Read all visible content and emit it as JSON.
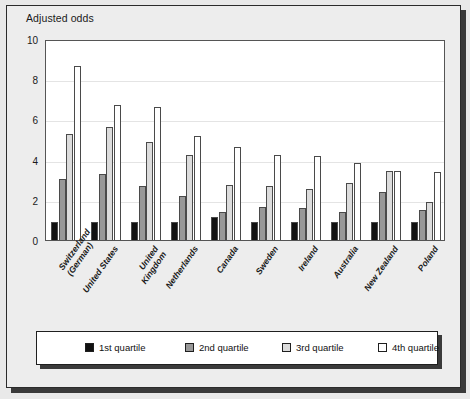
{
  "chart_data": {
    "type": "bar",
    "title": "Adjusted odds",
    "xlabel": "",
    "ylabel": "Adjusted odds",
    "ylim": [
      0,
      10
    ],
    "yticks": [
      0,
      2,
      4,
      6,
      8,
      10
    ],
    "grid": true,
    "legend_position": "bottom",
    "categories": [
      "Switzerland\n(German)",
      "United States",
      "United\nKingdom",
      "Netherlands",
      "Canada",
      "Sweden",
      "Ireland",
      "Australia",
      "New Zealand",
      "Poland"
    ],
    "series": [
      {
        "name": "1st quartile",
        "color": "#111111",
        "values": [
          1.0,
          1.0,
          1.0,
          1.0,
          1.25,
          1.0,
          1.0,
          1.0,
          1.0,
          1.0
        ]
      },
      {
        "name": "2nd quartile",
        "color": "#989898",
        "values": [
          3.15,
          3.4,
          2.8,
          2.3,
          1.5,
          1.75,
          1.7,
          1.5,
          2.5,
          1.6
        ]
      },
      {
        "name": "3rd quartile",
        "color": "#dcdcdc",
        "values": [
          5.35,
          5.7,
          5.0,
          4.35,
          2.85,
          2.8,
          2.65,
          2.95,
          3.55,
          2.0
        ]
      },
      {
        "name": "4th quartile",
        "color": "#ffffff",
        "values": [
          8.75,
          6.8,
          6.7,
          5.25,
          4.75,
          4.35,
          4.3,
          3.95,
          3.55,
          3.5
        ]
      }
    ]
  },
  "legend": {
    "items": [
      {
        "label": "1st quartile",
        "color": "#111111"
      },
      {
        "label": "2nd quartile",
        "color": "#989898"
      },
      {
        "label": "3rd quartile",
        "color": "#dcdcdc"
      },
      {
        "label": "4th quartile",
        "color": "#ffffff"
      }
    ]
  }
}
